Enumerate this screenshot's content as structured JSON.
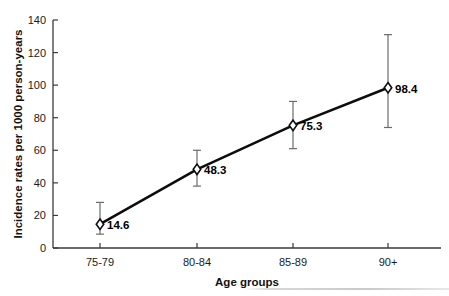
{
  "chart_data": {
    "type": "line",
    "title": "",
    "subtitle": "",
    "xlabel": "Age groups",
    "ylabel": "Incidence rates per 1000 person-years",
    "categories": [
      "75-79",
      "80-84",
      "85-89",
      "90+"
    ],
    "values": [
      14.6,
      48.3,
      75.3,
      98.4
    ],
    "point_labels": [
      "14.6",
      "48.3",
      "75.3",
      "98.4"
    ],
    "error_bars": {
      "lower": [
        8.5,
        38.0,
        61.0,
        74.0
      ],
      "upper": [
        28.0,
        60.0,
        90.0,
        131.0
      ]
    },
    "ylim": [
      0,
      140
    ],
    "yticks": [
      0,
      20,
      40,
      60,
      80,
      100,
      120,
      140
    ],
    "ytick_labels": [
      "0",
      "20",
      "40",
      "60",
      "80",
      "100",
      "120",
      "140"
    ],
    "grid": false,
    "legend": "none",
    "marker_style": "open-diamond",
    "line_color": "#0d0d0d",
    "marker_fill": "#ffffff",
    "error_bar_color": "#6b6b6b",
    "axis_color": "#3a3a3a"
  }
}
